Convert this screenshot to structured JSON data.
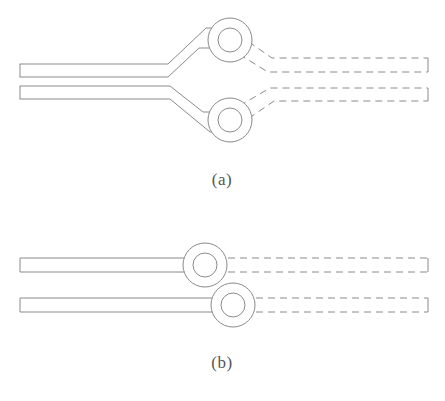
{
  "figure": {
    "background_color": "#ffffff",
    "line_color": "#8a8a8a",
    "caption_color": "#555555",
    "stroke_width": 1,
    "dash_pattern": "7,5",
    "panels": [
      {
        "id": "a",
        "label": "(a)",
        "label_x": 222,
        "label_y": 185,
        "description": "Two bus waveguides bend outward toward two vertically separated rings; dashed continuation to the right",
        "rings": [
          {
            "name": "ring-top",
            "cx": 230,
            "cy": 40,
            "r_outer": 22,
            "r_inner": 12
          },
          {
            "name": "ring-bottom",
            "cx": 230,
            "cy": 120,
            "r_outer": 22,
            "r_inner": 12
          }
        ],
        "solid_guides": [
          {
            "name": "bus-upper-solid",
            "points": "20,64 168,64 206,28 231,28"
          },
          {
            "name": "bus-upper-solid-lower-edge",
            "points": "20,77 168,77 199,48 231,48"
          },
          {
            "name": "bus-lower-solid",
            "points": "20,86 170,86 203,112 231,112"
          },
          {
            "name": "bus-lower-solid-lower-edge",
            "points": "20,99 170,99 210,132 231,132"
          }
        ],
        "dashed_guides": [
          {
            "name": "bus-upper-dashed",
            "points": "229,28 272,58 428,58"
          },
          {
            "name": "bus-upper-dashed-lower-edge",
            "points": "229,48 268,72 428,72"
          },
          {
            "name": "bus-lower-dashed",
            "points": "229,112 270,88 428,88"
          },
          {
            "name": "bus-lower-dashed-lower-edge",
            "points": "229,132 274,101 428,101"
          }
        ],
        "end_caps": [
          {
            "name": "cap-left-upper",
            "x": 20,
            "y1": 64,
            "y2": 77
          },
          {
            "name": "cap-left-lower",
            "x": 20,
            "y1": 86,
            "y2": 99
          },
          {
            "name": "cap-right-upper",
            "x": 428,
            "y1": 58,
            "y2": 72
          },
          {
            "name": "cap-right-lower",
            "x": 428,
            "y1": 88,
            "y2": 101
          }
        ]
      },
      {
        "id": "b",
        "label": "(b)",
        "label_x": 222,
        "label_y": 368,
        "description": "Two straight bus waveguides with laterally offset rings; dashed continuation to the right",
        "rings": [
          {
            "name": "ring-top",
            "cx": 205,
            "cy": 265,
            "r_outer": 22,
            "r_inner": 12
          },
          {
            "name": "ring-bottom",
            "cx": 233,
            "cy": 305,
            "r_outer": 22,
            "r_inner": 12
          }
        ],
        "solid_guides": [
          {
            "name": "bus-upper-solid",
            "points": "20,258 206,258"
          },
          {
            "name": "bus-upper-solid-lower-edge",
            "points": "20,272 206,272"
          },
          {
            "name": "bus-lower-solid",
            "points": "20,298 234,298"
          },
          {
            "name": "bus-lower-solid-lower-edge",
            "points": "20,312 234,312"
          }
        ],
        "dashed_guides": [
          {
            "name": "bus-upper-dashed",
            "points": "204,258 428,258"
          },
          {
            "name": "bus-upper-dashed-lower-edge",
            "points": "204,272 428,272"
          },
          {
            "name": "bus-lower-dashed",
            "points": "232,298 428,298"
          },
          {
            "name": "bus-lower-dashed-lower-edge",
            "points": "232,312 428,312"
          }
        ],
        "end_caps": [
          {
            "name": "cap-left-upper",
            "x": 20,
            "y1": 258,
            "y2": 272
          },
          {
            "name": "cap-left-lower",
            "x": 20,
            "y1": 298,
            "y2": 312
          },
          {
            "name": "cap-right-upper",
            "x": 428,
            "y1": 258,
            "y2": 272
          },
          {
            "name": "cap-right-lower",
            "x": 428,
            "y1": 298,
            "y2": 312
          }
        ]
      }
    ]
  }
}
